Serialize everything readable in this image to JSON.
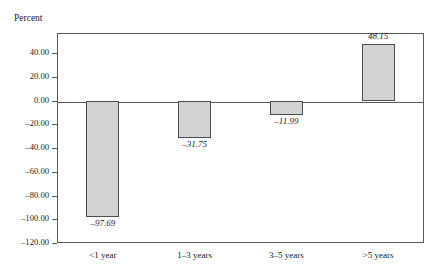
{
  "chart_data": {
    "type": "bar",
    "title": "",
    "subtitle": "",
    "xlabel": "",
    "ylabel": "Percent",
    "categories": [
      "<1 year",
      "1–3 years",
      "3–5 years",
      ">5 years"
    ],
    "values": [
      -97.69,
      -31.75,
      -11.99,
      48.15
    ],
    "data_labels": [
      "–97.69",
      "–31.75",
      "–11.99",
      "48.15"
    ],
    "ylim": [
      -120,
      57.2
    ],
    "ytick_values": [
      40,
      20,
      0,
      -20,
      -40,
      -60,
      -80,
      -100,
      -120
    ],
    "ytick_labels": [
      "40.00",
      "20.00",
      "0.00",
      "–20.00",
      "–40.00",
      "–60.00",
      "–80.00",
      "–100.00",
      "–120.00"
    ],
    "grid": false,
    "legend": null,
    "bar_fill_color": "#d3d3d3",
    "bar_edge_color": "#4a4f53",
    "axis_color": "#555a5e",
    "background_color": "#ffffff"
  }
}
